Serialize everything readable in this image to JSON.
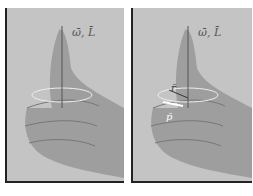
{
  "figure": {
    "panels": [
      {
        "id": "left",
        "label": "ω̄, L̄",
        "description": "right hand thumb up, curl around axis"
      },
      {
        "id": "right",
        "label": "ω̄, L̄",
        "vectors": [
          {
            "name": "r",
            "label": "r̄"
          },
          {
            "name": "p",
            "label": "p̄"
          }
        ]
      }
    ]
  },
  "colors": {
    "background": "#c4c4c4",
    "hand": "#9a9a9a",
    "border": "#222222"
  }
}
